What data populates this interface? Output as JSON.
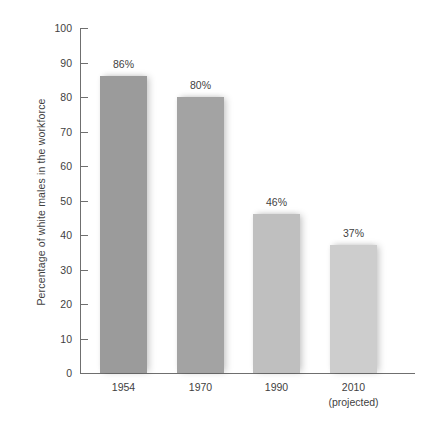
{
  "chart_data": {
    "type": "bar",
    "title": "",
    "subtitle": "",
    "xlabel": "",
    "ylabel": "Percentage of white males in the workforce",
    "categories": [
      "1954",
      "1970",
      "1990",
      "2010"
    ],
    "category_sublabels": [
      "",
      "",
      "",
      "(projected)"
    ],
    "values": [
      86,
      80,
      46,
      37
    ],
    "data_labels": [
      "86%",
      "80%",
      "46%",
      "37%"
    ],
    "ylim": [
      0,
      100
    ],
    "ytick_values": [
      0,
      10,
      20,
      30,
      40,
      50,
      60,
      70,
      80,
      90,
      100
    ],
    "ytick_labels": [
      "0",
      "10",
      "20",
      "30",
      "40",
      "50",
      "60",
      "70",
      "80",
      "90",
      "100"
    ],
    "grid": false,
    "legend": null,
    "legend_position": "none",
    "bar_colors": [
      "#9b9b9b",
      "#a3a3a3",
      "#bfbfbf",
      "#cdcdcd"
    ],
    "axis_color": "#6f6f6f",
    "text_color": "#3f3f3f",
    "background_color": "#ffffff"
  }
}
